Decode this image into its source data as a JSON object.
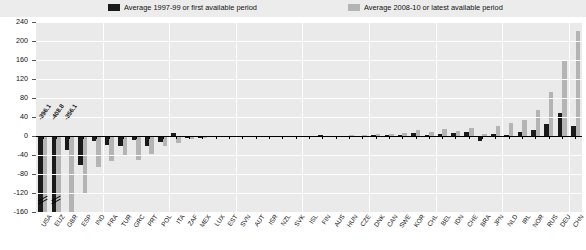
{
  "legend": {
    "series1_label": "Average 1997-99 or first available period",
    "series2_label": "Average 2008-10 or latest available period",
    "series1_color": "#1a1a1a",
    "series2_color": "#b4b4b4"
  },
  "axis": {
    "y_ticks": [
      "240",
      "200",
      "160",
      "120",
      "80",
      "40",
      "0",
      "-40",
      "-80",
      "-120",
      "-160"
    ]
  },
  "value_labels": [
    "-396.1",
    "-408.8",
    "-356.1"
  ],
  "chart_data": {
    "type": "bar",
    "title": "",
    "xlabel": "",
    "ylabel": "",
    "ylim": [
      -160,
      240
    ],
    "grid": true,
    "legend_position": "top",
    "categories": [
      "USA",
      "EUZ",
      "GBR",
      "ESP",
      "IND",
      "FRA",
      "TUR",
      "GRC",
      "PRT",
      "POL",
      "ITA",
      "ZAF",
      "MEX",
      "LUX",
      "EST",
      "SVN",
      "AUT",
      "ISR",
      "NZL",
      "SVK",
      "ISL",
      "FIN",
      "AUS",
      "HUN",
      "CZE",
      "DNK",
      "CAN",
      "SWE",
      "KOR",
      "CHL",
      "BEL",
      "IDN",
      "CHE",
      "BRA",
      "JPN",
      "NLD",
      "IRL",
      "NOR",
      "RUS",
      "DEU",
      "CHN"
    ],
    "series": [
      {
        "name": "Average 1997-99 or first available period",
        "values": [
          -160,
          -160,
          -30,
          -62,
          -10,
          -18,
          -22,
          -8,
          -20,
          -12,
          6,
          -4,
          -5,
          -3,
          -2,
          -2,
          -2,
          -2,
          -1,
          -1,
          -1,
          2,
          -2,
          -2,
          -3,
          2,
          2,
          3,
          6,
          3,
          5,
          7,
          8,
          -10,
          5,
          2,
          9,
          12,
          26,
          48,
          22
        ]
      },
      {
        "name": "Average 2008-10 or latest available period",
        "values": [
          -396.1,
          -408.8,
          -356.1,
          -120,
          -66,
          -52,
          -42,
          -50,
          -38,
          -22,
          -14,
          -6,
          -4,
          -3,
          -2,
          -2,
          -2,
          -1,
          -1,
          -1,
          -1,
          1,
          1,
          2,
          3,
          4,
          5,
          7,
          12,
          8,
          14,
          10,
          16,
          4,
          22,
          28,
          34,
          54,
          92,
          158,
          222
        ]
      }
    ]
  }
}
